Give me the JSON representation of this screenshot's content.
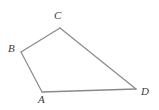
{
  "figure": {
    "kind": "geometry-diagram",
    "shape_name": "quadrilateral",
    "width": 159,
    "height": 110,
    "background_color": "#ffffff",
    "stroke_color": "#8a8a8a",
    "stroke_width": 1.2,
    "label_color": "#3b3b3b",
    "vertices": [
      {
        "id": "A",
        "label": "A",
        "x": 42,
        "y": 92,
        "label_x": 38,
        "label_y": 94
      },
      {
        "id": "B",
        "label": "B",
        "x": 21,
        "y": 52,
        "label_x": 8,
        "label_y": 43
      },
      {
        "id": "C",
        "label": "C",
        "x": 60,
        "y": 28,
        "label_x": 54,
        "label_y": 10
      },
      {
        "id": "D",
        "label": "D",
        "x": 136,
        "y": 89,
        "label_x": 141,
        "label_y": 86
      }
    ],
    "edges": [
      {
        "id": "AB",
        "from": "A",
        "to": "B"
      },
      {
        "id": "BC",
        "from": "B",
        "to": "C"
      },
      {
        "id": "CD",
        "from": "C",
        "to": "D"
      },
      {
        "id": "DA",
        "from": "D",
        "to": "A"
      }
    ],
    "labels": {
      "A": "A",
      "B": "B",
      "C": "C",
      "D": "D"
    }
  }
}
